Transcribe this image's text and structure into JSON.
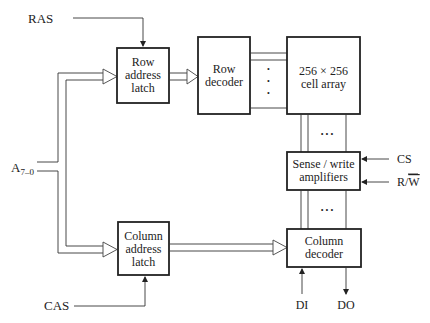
{
  "diagram": {
    "blocks": {
      "row_address_latch": {
        "lines": [
          "Row",
          "address",
          "latch"
        ]
      },
      "row_decoder": {
        "lines": [
          "Row",
          "decoder"
        ]
      },
      "cell_array": {
        "lines": [
          "256 × 256",
          "cell array"
        ]
      },
      "sense_write_amplifiers": {
        "lines": [
          "Sense / write",
          "amplifiers"
        ]
      },
      "column_address_latch": {
        "lines": [
          "Column",
          "address",
          "latch"
        ]
      },
      "column_decoder": {
        "lines": [
          "Column",
          "decoder"
        ]
      }
    },
    "signals": {
      "ras": "RAS",
      "cas": "CAS",
      "address_main": "A",
      "address_sub": "7–0",
      "cs": "CS",
      "rw_r": "R/",
      "rw_w": "W",
      "di": "DI",
      "do": "DO"
    },
    "ellipsis": {
      "vertical": "•",
      "horizontal": "• • •"
    }
  }
}
